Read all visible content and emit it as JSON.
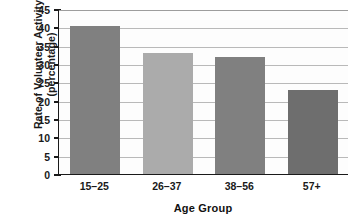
{
  "chart_data": {
    "type": "bar",
    "title": "",
    "categories": [
      "15–25",
      "26–37",
      "38–56",
      "57+"
    ],
    "values": [
      40.5,
      33,
      32,
      23
    ],
    "series": [
      {
        "name": "Rate of Volunteer Activity",
        "values": [
          40.5,
          33,
          32,
          23
        ]
      }
    ],
    "xlabel": "Age Group",
    "ylabel": "Rate of Volunteer Activity (percentage)",
    "ylabel_lines": [
      "Rate of Volunteer Activity",
      "(percentage)"
    ],
    "ylim": [
      0,
      45
    ],
    "ytick_values": [
      0,
      5,
      10,
      15,
      20,
      25,
      30,
      35,
      40,
      45
    ],
    "ytick_labels": [
      "0",
      "5",
      "10",
      "15",
      "20",
      "25",
      "30",
      "35",
      "40",
      "45"
    ],
    "grid": true,
    "grid_axis": "y",
    "legend": false,
    "legend_position": "none",
    "bar_colors": [
      "#808080",
      "#ababab",
      "#808080",
      "#6e6e6e"
    ],
    "axis_color": "#1a1a1a",
    "gridline_color": "#b9b9b9",
    "plot_background": "#fdfdfd",
    "page_background": "#ffffff"
  }
}
